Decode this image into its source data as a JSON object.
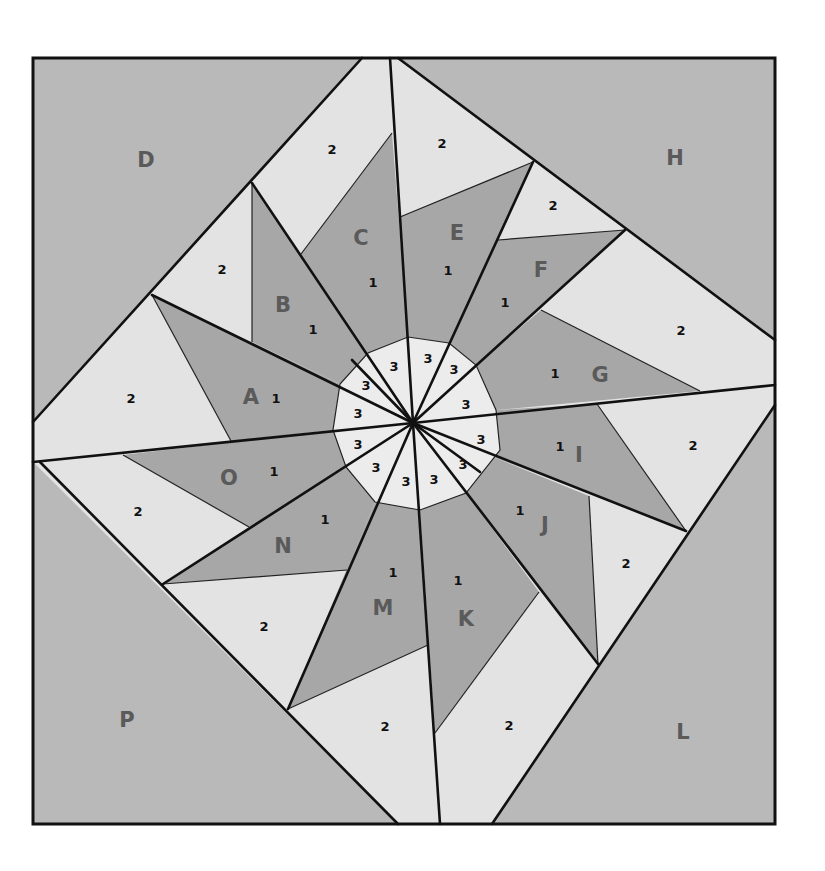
{
  "diagram": {
    "type": "foundation-paper-piecing quilt block pattern",
    "colors": {
      "corner_fill": "#b9b9b9",
      "background_fill": "#e3e3e3",
      "star_point_fill": "#a7a7a7",
      "hub_fill": "#ececec",
      "line": "#111111",
      "section_letter": "#5a5a5a"
    },
    "corner_sections": [
      {
        "letter": "D",
        "x": 146,
        "y": 160
      },
      {
        "letter": "H",
        "x": 675,
        "y": 158
      },
      {
        "letter": "L",
        "x": 683,
        "y": 732
      },
      {
        "letter": "P",
        "x": 127,
        "y": 720
      }
    ],
    "star_sections": [
      {
        "letter": "A",
        "lx": 251,
        "ly": 397,
        "n1": "1",
        "n1x": 276,
        "n1y": 398
      },
      {
        "letter": "B",
        "lx": 283,
        "ly": 305,
        "n1": "1",
        "n1x": 313,
        "n1y": 329
      },
      {
        "letter": "C",
        "lx": 361,
        "ly": 238,
        "n1": "1",
        "n1x": 373,
        "n1y": 282
      },
      {
        "letter": "E",
        "lx": 457,
        "ly": 233,
        "n1": "1",
        "n1x": 448,
        "n1y": 270
      },
      {
        "letter": "F",
        "lx": 541,
        "ly": 270,
        "n1": "1",
        "n1x": 505,
        "n1y": 302
      },
      {
        "letter": "G",
        "lx": 600,
        "ly": 375,
        "n1": "1",
        "n1x": 555,
        "n1y": 373
      },
      {
        "letter": "I",
        "lx": 579,
        "ly": 455,
        "n1": "1",
        "n1x": 560,
        "n1y": 446
      },
      {
        "letter": "J",
        "lx": 545,
        "ly": 525,
        "n1": "1",
        "n1x": 520,
        "n1y": 510
      },
      {
        "letter": "K",
        "lx": 466,
        "ly": 619,
        "n1": "1",
        "n1x": 458,
        "n1y": 580
      },
      {
        "letter": "M",
        "lx": 383,
        "ly": 608,
        "n1": "1",
        "n1x": 393,
        "n1y": 572
      },
      {
        "letter": "N",
        "lx": 283,
        "ly": 546,
        "n1": "1",
        "n1x": 325,
        "n1y": 519
      },
      {
        "letter": "O",
        "lx": 229,
        "ly": 478,
        "n1": "1",
        "n1x": 274,
        "n1y": 471
      }
    ],
    "background_labels": [
      {
        "text": "2",
        "x": 332,
        "y": 149
      },
      {
        "text": "2",
        "x": 442,
        "y": 143
      },
      {
        "text": "2",
        "x": 553,
        "y": 205
      },
      {
        "text": "2",
        "x": 222,
        "y": 269
      },
      {
        "text": "2",
        "x": 681,
        "y": 330
      },
      {
        "text": "2",
        "x": 131,
        "y": 398
      },
      {
        "text": "2",
        "x": 693,
        "y": 445
      },
      {
        "text": "2",
        "x": 138,
        "y": 511
      },
      {
        "text": "2",
        "x": 626,
        "y": 563
      },
      {
        "text": "2",
        "x": 264,
        "y": 626
      },
      {
        "text": "2",
        "x": 385,
        "y": 726
      },
      {
        "text": "2",
        "x": 509,
        "y": 725
      }
    ],
    "hub_labels": [
      {
        "text": "3",
        "x": 394,
        "y": 366
      },
      {
        "text": "3",
        "x": 428,
        "y": 358
      },
      {
        "text": "3",
        "x": 454,
        "y": 369
      },
      {
        "text": "3",
        "x": 366,
        "y": 385
      },
      {
        "text": "3",
        "x": 466,
        "y": 404
      },
      {
        "text": "3",
        "x": 358,
        "y": 413
      },
      {
        "text": "3",
        "x": 481,
        "y": 439
      },
      {
        "text": "3",
        "x": 358,
        "y": 444
      },
      {
        "text": "3",
        "x": 463,
        "y": 464
      },
      {
        "text": "3",
        "x": 376,
        "y": 467
      },
      {
        "text": "3",
        "x": 406,
        "y": 481
      },
      {
        "text": "3",
        "x": 434,
        "y": 479
      }
    ]
  }
}
